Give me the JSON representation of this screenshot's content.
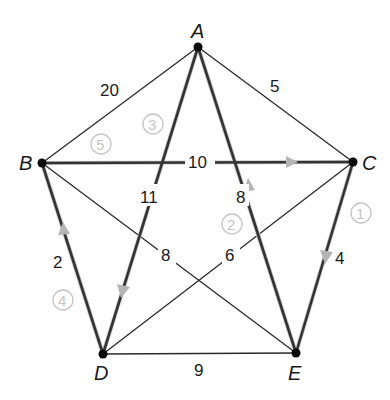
{
  "diagram": {
    "type": "weighted complete graph with Hamiltonian circuit",
    "vertices": [
      {
        "id": "A",
        "label": "A",
        "x": 198,
        "y": 47
      },
      {
        "id": "B",
        "label": "B",
        "x": 42,
        "y": 163
      },
      {
        "id": "C",
        "label": "C",
        "x": 353,
        "y": 162
      },
      {
        "id": "D",
        "label": "D",
        "x": 103,
        "y": 354
      },
      {
        "id": "E",
        "label": "E",
        "x": 296,
        "y": 353
      }
    ],
    "edges": [
      {
        "from": "A",
        "to": "B",
        "weight": "20",
        "in_tour": false
      },
      {
        "from": "A",
        "to": "C",
        "weight": "5",
        "in_tour": false
      },
      {
        "from": "A",
        "to": "D",
        "weight": "11",
        "in_tour": true
      },
      {
        "from": "A",
        "to": "E",
        "weight": "8",
        "in_tour": true
      },
      {
        "from": "B",
        "to": "C",
        "weight": "10",
        "in_tour": true
      },
      {
        "from": "B",
        "to": "D",
        "weight": "2",
        "in_tour": true
      },
      {
        "from": "B",
        "to": "E",
        "weight": "8",
        "in_tour": false
      },
      {
        "from": "C",
        "to": "D",
        "weight": "6",
        "in_tour": false
      },
      {
        "from": "C",
        "to": "E",
        "weight": "4",
        "in_tour": true
      },
      {
        "from": "D",
        "to": "E",
        "weight": "9",
        "in_tour": false
      }
    ],
    "tour_steps": [
      {
        "order": "1",
        "from": "C",
        "to": "E"
      },
      {
        "order": "2",
        "from": "E",
        "to": "A"
      },
      {
        "order": "3",
        "from": "A",
        "to": "D"
      },
      {
        "order": "4",
        "from": "D",
        "to": "B"
      },
      {
        "order": "5",
        "from": "B",
        "to": "C"
      }
    ],
    "colors": {
      "edge": "#2a2a2a",
      "node": "#0a0a0a",
      "annotation": "#c4c4c4",
      "arrow": "#b5b5b5"
    }
  }
}
